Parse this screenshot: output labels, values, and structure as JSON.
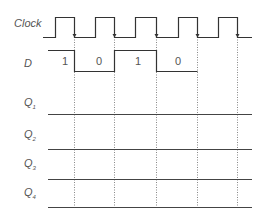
{
  "diagram": {
    "type": "timing-diagram",
    "signals": [
      {
        "name": "Clock",
        "label": "Clock"
      },
      {
        "name": "D",
        "label": "D",
        "values": [
          "1",
          "0",
          "1",
          "0"
        ]
      },
      {
        "name": "Q1",
        "label": "Q",
        "sub": "1"
      },
      {
        "name": "Q2",
        "label": "Q",
        "sub": "2"
      },
      {
        "name": "Q3",
        "label": "Q",
        "sub": "3"
      },
      {
        "name": "Q4",
        "label": "Q",
        "sub": "4"
      }
    ],
    "clock_pulses": 5,
    "colors": {
      "line": "#333333",
      "dotted": "#888888",
      "text": "#555555"
    }
  }
}
